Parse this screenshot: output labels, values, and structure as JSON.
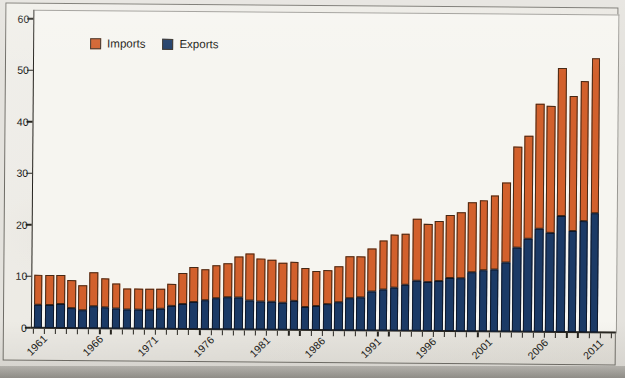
{
  "legend": {
    "items": [
      {
        "label": "Imports",
        "color": "#d2602c"
      },
      {
        "label": "Exports",
        "color": "#1b3a66"
      }
    ]
  },
  "y_axis": {
    "tick_labels": [
      "0",
      "10",
      "20",
      "30",
      "40",
      "50",
      "60"
    ]
  },
  "x_axis": {
    "tick_labels": [
      "1961",
      "1966",
      "1971",
      "1976",
      "1981",
      "1986",
      "1991",
      "1996",
      "2001",
      "2006",
      "2011"
    ]
  },
  "chart_data": {
    "type": "bar",
    "stacked": true,
    "title": "",
    "xlabel": "",
    "ylabel": "",
    "ylim": [
      0,
      60
    ],
    "yticks": [
      0,
      10,
      20,
      30,
      40,
      50,
      60
    ],
    "grid": false,
    "legend_position": "top-left",
    "x": [
      1961,
      1962,
      1963,
      1964,
      1965,
      1966,
      1967,
      1968,
      1969,
      1970,
      1971,
      1972,
      1973,
      1974,
      1975,
      1976,
      1977,
      1978,
      1979,
      1980,
      1981,
      1982,
      1983,
      1984,
      1985,
      1986,
      1987,
      1988,
      1989,
      1990,
      1991,
      1992,
      1993,
      1994,
      1995,
      1996,
      1997,
      1998,
      1999,
      2000,
      2001,
      2002,
      2003,
      2004,
      2005,
      2006,
      2007,
      2008,
      2009,
      2010,
      2011
    ],
    "labeled_years": [
      1961,
      1966,
      1971,
      1976,
      1981,
      1986,
      1991,
      1996,
      2001,
      2006,
      2011
    ],
    "series": [
      {
        "name": "Exports",
        "color": "#1b3a66",
        "stack": "bottom",
        "values": [
          4.5,
          4.5,
          4.6,
          3.9,
          3.5,
          4.3,
          4.0,
          3.8,
          3.6,
          3.7,
          3.7,
          3.9,
          4.4,
          4.9,
          5.3,
          5.6,
          6.1,
          6.2,
          6.3,
          5.6,
          5.5,
          5.5,
          5.3,
          5.6,
          4.5,
          4.7,
          5.0,
          5.5,
          6.3,
          6.4,
          7.6,
          7.9,
          8.4,
          8.9,
          9.8,
          9.5,
          9.7,
          10.2,
          10.3,
          11.5,
          11.8,
          12.0,
          13.4,
          16.4,
          18.0,
          20.0,
          19.2,
          22.5,
          19.7,
          21.5,
          23.2
        ]
      },
      {
        "name": "Imports",
        "color": "#d2602c",
        "stack": "top",
        "values": [
          5.8,
          5.8,
          5.6,
          5.4,
          4.9,
          6.5,
          5.8,
          5.0,
          4.2,
          4.0,
          4.0,
          3.9,
          4.4,
          5.9,
          6.8,
          6.0,
          6.4,
          6.6,
          7.9,
          9.2,
          8.2,
          8.0,
          7.8,
          7.7,
          7.6,
          6.8,
          6.6,
          7.0,
          8.0,
          8.0,
          8.4,
          9.5,
          10.2,
          10.0,
          11.9,
          11.3,
          11.7,
          12.3,
          12.9,
          13.5,
          13.7,
          14.5,
          15.6,
          19.5,
          20.1,
          24.3,
          24.6,
          28.8,
          26.1,
          27.2,
          30.1
        ]
      }
    ]
  }
}
